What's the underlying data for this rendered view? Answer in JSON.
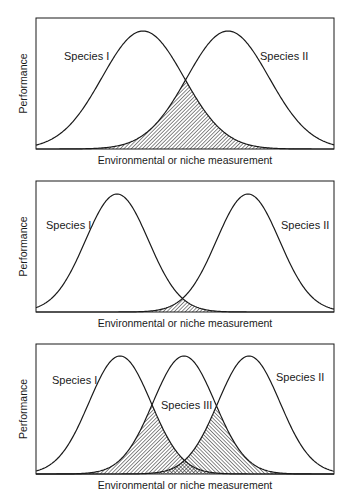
{
  "figure": {
    "panels": [
      {
        "id": "panel-1",
        "ylabel": "Performance",
        "xlabel": "Environmental or niche measurement",
        "box": {
          "x0": 36,
          "y0": 18,
          "x1": 334,
          "y1": 149
        },
        "curves": [
          {
            "name": "Species I",
            "peak_x": 143,
            "sigma": 41,
            "label": "Species I",
            "label_x": 64,
            "label_y": 60
          },
          {
            "name": "Species II",
            "peak_x": 228,
            "sigma": 41,
            "label": "Species II",
            "label_x": 260,
            "label_y": 60
          }
        ],
        "overlaps": [
          {
            "between": [
              0,
              1
            ],
            "hatch": "fwd"
          }
        ]
      },
      {
        "id": "panel-2",
        "ylabel": "Performance",
        "xlabel": "Environmental or niche measurement",
        "box": {
          "x0": 36,
          "y0": 181,
          "x1": 334,
          "y1": 312
        },
        "curves": [
          {
            "name": "Species I",
            "peak_x": 117,
            "sigma": 31.5,
            "label": "Species I",
            "label_x": 46,
            "label_y": 229
          },
          {
            "name": "Species II",
            "peak_x": 248,
            "sigma": 31.5,
            "label": "Species II",
            "label_x": 281,
            "label_y": 229
          }
        ],
        "overlaps": [
          {
            "between": [
              0,
              1
            ],
            "hatch": "fwd"
          }
        ]
      },
      {
        "id": "panel-3",
        "ylabel": "Performance",
        "xlabel": "Environmental or niche measurement",
        "box": {
          "x0": 36,
          "y0": 344,
          "x1": 334,
          "y1": 474
        },
        "curves": [
          {
            "name": "Species I",
            "peak_x": 120,
            "sigma": 31,
            "label": "Species I",
            "label_x": 52,
            "label_y": 384
          },
          {
            "name": "Species III",
            "peak_x": 184,
            "sigma": 31,
            "label": "Species III",
            "label_x": 161,
            "label_y": 409
          },
          {
            "name": "Species II",
            "peak_x": 249,
            "sigma": 31,
            "label": "Species II",
            "label_x": 276,
            "label_y": 381
          }
        ],
        "overlaps": [
          {
            "between": [
              0,
              1
            ],
            "hatch": "fwd"
          },
          {
            "between": [
              1,
              2
            ],
            "hatch": "back"
          }
        ]
      }
    ],
    "peak_height": 118,
    "colors": {
      "line": "#1a1a1a",
      "hatch": "#2a2a2a",
      "background": "#ffffff"
    }
  },
  "chart_data": [
    {
      "type": "line",
      "title": "",
      "xlabel": "Environmental or niche measurement",
      "ylabel": "Performance",
      "series": [
        {
          "name": "Species I",
          "shape": "gaussian",
          "center": 0.36,
          "relative_width": 0.14
        },
        {
          "name": "Species II",
          "shape": "gaussian",
          "center": 0.64,
          "relative_width": 0.14
        }
      ],
      "annotations": [
        "Shaded overlap region between Species I and Species II (large overlap)"
      ]
    },
    {
      "type": "line",
      "title": "",
      "xlabel": "Environmental or niche measurement",
      "ylabel": "Performance",
      "series": [
        {
          "name": "Species I",
          "shape": "gaussian",
          "center": 0.27,
          "relative_width": 0.106
        },
        {
          "name": "Species II",
          "shape": "gaussian",
          "center": 0.71,
          "relative_width": 0.106
        }
      ],
      "annotations": [
        "Small shaded overlap region between Species I and Species II"
      ]
    },
    {
      "type": "line",
      "title": "",
      "xlabel": "Environmental or niche measurement",
      "ylabel": "Performance",
      "series": [
        {
          "name": "Species I",
          "shape": "gaussian",
          "center": 0.28,
          "relative_width": 0.104
        },
        {
          "name": "Species III",
          "shape": "gaussian",
          "center": 0.5,
          "relative_width": 0.104
        },
        {
          "name": "Species II",
          "shape": "gaussian",
          "center": 0.71,
          "relative_width": 0.104
        }
      ],
      "annotations": [
        "Shaded overlaps: Species I with Species III, Species III with Species II; cross-hatched where all overlap"
      ]
    }
  ]
}
